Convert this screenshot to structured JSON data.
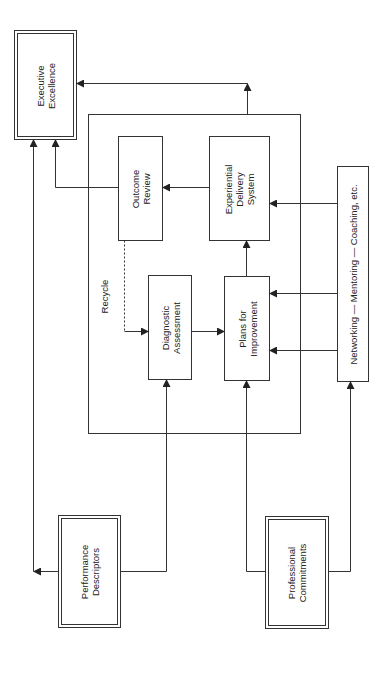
{
  "diagram": {
    "nodes": {
      "executive_excellence": "Executive\nExcellence",
      "outcome_review": "Outcome\nReview",
      "experiential_delivery_system": "Experiential\nDelivery\nSystem",
      "diagnostic_assessment": "Diagnostic\nAssessment",
      "plans_for_improvement": "Plans for\nImprovement",
      "networking": "Networking — Mentoring — Coaching, etc.",
      "performance_descriptors": "Performance\nDescriptors",
      "professional_commitments": "Professional\nCommitments"
    },
    "edge_labels": {
      "recycle": "Recycle"
    },
    "colors": {
      "line": "#333333",
      "background": "#ffffff"
    }
  }
}
